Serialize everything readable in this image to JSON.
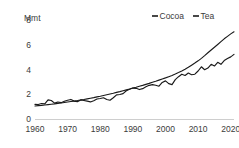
{
  "chart_data": {
    "type": "line",
    "title": "",
    "xlabel": "",
    "ylabel": "Mmt",
    "yunit_label": "Mmt",
    "xlim": [
      1960,
      2021
    ],
    "ylim": [
      0,
      8
    ],
    "grid": false,
    "legend_position": "top-right",
    "ytick_labels": [
      "0",
      "2",
      "4",
      "6",
      "8"
    ],
    "ytick_values": [
      0,
      2,
      4,
      6,
      8
    ],
    "xtick_labels": [
      "1960",
      "1970",
      "1980",
      "1990",
      "2000",
      "2010",
      "2020"
    ],
    "xtick_values": [
      1960,
      1970,
      1980,
      1990,
      2000,
      2010,
      2020
    ],
    "x": [
      1960,
      1961,
      1962,
      1963,
      1964,
      1965,
      1966,
      1967,
      1968,
      1969,
      1970,
      1971,
      1972,
      1973,
      1974,
      1975,
      1976,
      1977,
      1978,
      1979,
      1980,
      1981,
      1982,
      1983,
      1984,
      1985,
      1986,
      1987,
      1988,
      1989,
      1990,
      1991,
      1992,
      1993,
      1994,
      1995,
      1996,
      1997,
      1998,
      1999,
      2000,
      2001,
      2002,
      2003,
      2004,
      2005,
      2006,
      2007,
      2008,
      2009,
      2010,
      2011,
      2012,
      2013,
      2014,
      2015,
      2016,
      2017,
      2018,
      2019,
      2020,
      2021
    ],
    "series": [
      {
        "name": "Cocoa",
        "color": "#1a1a1a",
        "style": "volatile",
        "values": [
          1.18,
          1.17,
          1.25,
          1.22,
          1.55,
          1.5,
          1.28,
          1.37,
          1.32,
          1.43,
          1.52,
          1.58,
          1.45,
          1.4,
          1.54,
          1.5,
          1.44,
          1.38,
          1.48,
          1.62,
          1.66,
          1.72,
          1.58,
          1.52,
          1.72,
          1.95,
          1.98,
          2.05,
          2.28,
          2.4,
          2.5,
          2.48,
          2.38,
          2.45,
          2.6,
          2.72,
          2.78,
          2.73,
          2.65,
          2.95,
          3.08,
          2.86,
          2.78,
          3.18,
          3.42,
          3.62,
          3.52,
          3.72,
          3.58,
          3.62,
          3.88,
          4.22,
          3.98,
          4.12,
          4.42,
          4.28,
          4.58,
          4.42,
          4.72,
          4.88,
          5.02,
          5.22
        ]
      },
      {
        "name": "Tea",
        "color": "#1a1a1a",
        "style": "smooth",
        "values": [
          1.05,
          1.08,
          1.1,
          1.13,
          1.16,
          1.19,
          1.22,
          1.26,
          1.29,
          1.33,
          1.37,
          1.41,
          1.45,
          1.49,
          1.54,
          1.58,
          1.63,
          1.68,
          1.73,
          1.79,
          1.84,
          1.9,
          1.96,
          2.02,
          2.08,
          2.15,
          2.21,
          2.28,
          2.35,
          2.42,
          2.5,
          2.57,
          2.65,
          2.72,
          2.8,
          2.88,
          2.97,
          3.05,
          3.14,
          3.23,
          3.32,
          3.42,
          3.52,
          3.63,
          3.75,
          3.88,
          4.02,
          4.18,
          4.35,
          4.52,
          4.7,
          4.9,
          5.12,
          5.35,
          5.58,
          5.8,
          6.02,
          6.25,
          6.48,
          6.68,
          6.88,
          7.05
        ]
      }
    ]
  },
  "legend": {
    "items": [
      {
        "label": "Cocoa"
      },
      {
        "label": "Tea"
      }
    ]
  }
}
